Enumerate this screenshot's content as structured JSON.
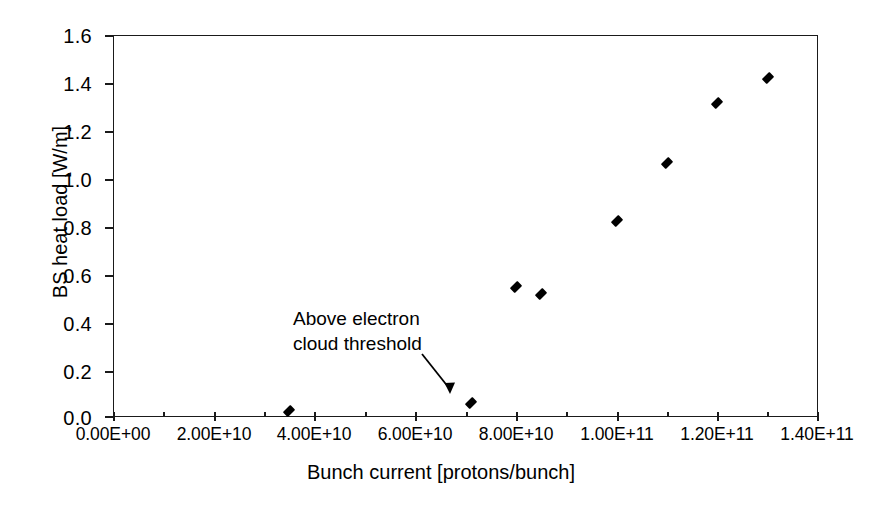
{
  "chart_data": {
    "type": "scatter",
    "title": "",
    "xlabel": "Bunch current [protons/bunch]",
    "ylabel": "BS heat load [W/m]",
    "xlim": [
      0,
      140000000000.0
    ],
    "ylim": [
      0,
      1.6
    ],
    "grid": false,
    "legend": null,
    "marker": "filled-diamond",
    "marker_color": "#000000",
    "x_tick_labels": [
      "0.00E+00",
      "2.00E+10",
      "4.00E+10",
      "6.00E+10",
      "8.00E+10",
      "1.00E+11",
      "1.20E+11",
      "1.40E+11"
    ],
    "x_tick_values": [
      0,
      20000000000.0,
      40000000000.0,
      60000000000.0,
      80000000000.0,
      100000000000.0,
      120000000000.0,
      140000000000.0
    ],
    "x_minor_tick_values": [
      10000000000.0,
      30000000000.0,
      50000000000.0,
      70000000000.0,
      90000000000.0,
      110000000000.0,
      130000000000.0
    ],
    "y_tick_labels": [
      "0.0",
      "0.2",
      "0.4",
      "0.6",
      "0.8",
      "1.0",
      "1.2",
      "1.4",
      "1.6"
    ],
    "y_tick_values": [
      0.0,
      0.2,
      0.4,
      0.6,
      0.8,
      1.0,
      1.2,
      1.4,
      1.6
    ],
    "series": [
      {
        "name": "BS heat load",
        "points": [
          {
            "x": 35000000000.0,
            "y": 0.025
          },
          {
            "x": 71000000000.0,
            "y": 0.06
          },
          {
            "x": 80000000000.0,
            "y": 0.545
          },
          {
            "x": 85000000000.0,
            "y": 0.515
          },
          {
            "x": 100000000000.0,
            "y": 0.82
          },
          {
            "x": 110000000000.0,
            "y": 1.065
          },
          {
            "x": 120000000000.0,
            "y": 1.315
          },
          {
            "x": 130000000000.0,
            "y": 1.42
          }
        ]
      }
    ],
    "annotations": [
      {
        "text_line_1": "Above electron",
        "text_line_2": "cloud threshold",
        "points_to": {
          "x": 71000000000.0,
          "y": 0.06
        },
        "arrow": "diagonal-down-right"
      }
    ]
  }
}
